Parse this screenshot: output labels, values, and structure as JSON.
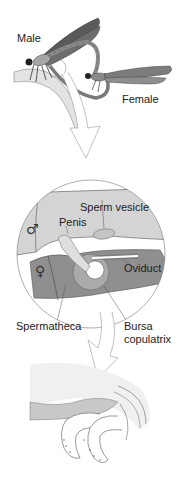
{
  "diagram": {
    "type": "biological-illustration",
    "colors": {
      "male_region": "#d4d4d4",
      "female_region": "#8f8f8f",
      "outline": "#555555",
      "insect_dark": "#4a4a4a",
      "insect_mid": "#9a9a9a",
      "background": "#ffffff"
    },
    "panels": [
      {
        "id": "mating-pair",
        "labels": {
          "male": "Male",
          "female": "Female"
        }
      },
      {
        "id": "reproductive-detail-circle",
        "symbols": {
          "male": "♂",
          "female": "♀"
        },
        "labels": {
          "sperm_vesicle": "Sperm vesicle",
          "penis": "Penis",
          "oviduct": "Oviduct",
          "spermatheca": "Spermatheca",
          "bursa_copulatrix_line1": "Bursa",
          "bursa_copulatrix_line2": "copulatrix"
        }
      },
      {
        "id": "penis-tip-detail",
        "labels": {}
      }
    ],
    "arrows": [
      {
        "from": "mating-pair",
        "to": "reproductive-detail-circle"
      },
      {
        "from": "reproductive-detail-circle",
        "to": "penis-tip-detail"
      }
    ]
  }
}
